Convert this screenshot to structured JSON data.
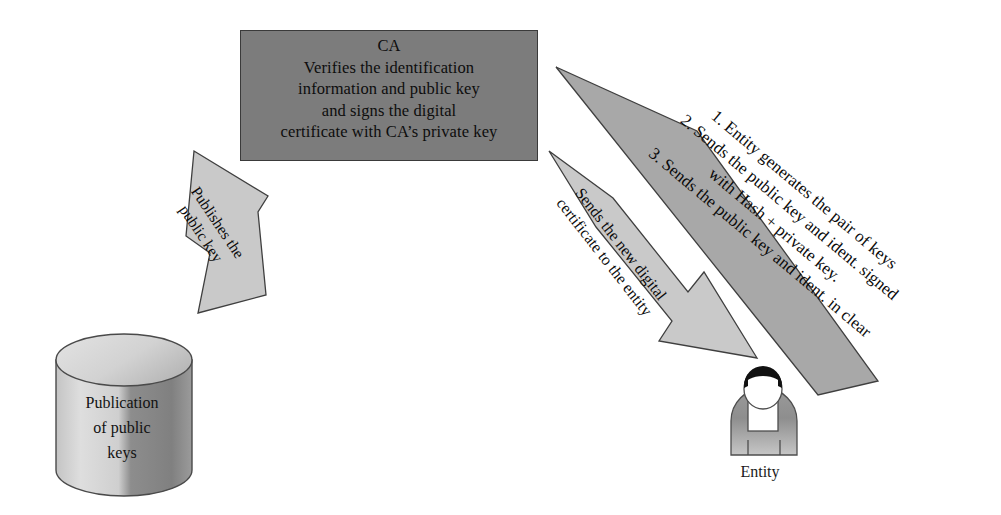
{
  "diagram": {
    "background_color": "#ffffff"
  },
  "ca_box": {
    "fill_color": "#7c7c7c",
    "lines": [
      "CA",
      "Verifies the identification",
      "information and public key",
      "and signs the digital",
      "certificate with CA’s private key"
    ]
  },
  "database": {
    "name": "publication-database-cylinder",
    "fill_light": "#d9d9d9",
    "fill_dark": "#8f8f8f",
    "lines": [
      "Publication",
      "of public",
      "keys"
    ]
  },
  "entity": {
    "label": "Entity",
    "head_color": "#111111",
    "face_color": "#ffffff",
    "body_color": "#8a8a8a"
  },
  "arrows": {
    "publishes": {
      "fill_color": "#c9c9c9",
      "direction": "down-left",
      "lines": [
        "Publishes the",
        "public key"
      ]
    },
    "certificate": {
      "fill_color": "#c9c9c9",
      "direction": "down-right",
      "lines": [
        "Sends the new digital",
        "certificate to the entity"
      ]
    },
    "steps": {
      "fill_color": "#a8a8a8",
      "direction": "up-left",
      "lines": [
        "1. Entity generates the pair of keys",
        "2. Sends the public key and ident. signed",
        "with Hash + private key.",
        "3. Sends the public key and ident. in clear"
      ]
    }
  }
}
